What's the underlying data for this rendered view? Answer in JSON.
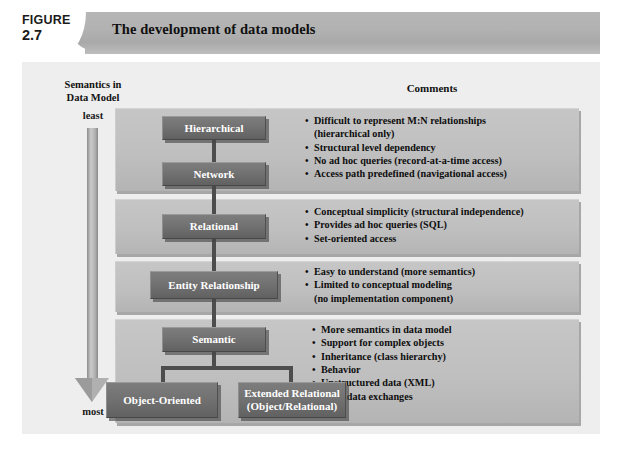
{
  "figure": {
    "label_word": "FIGURE",
    "number": "2.7",
    "title": "The development of data models"
  },
  "columns": {
    "left_heading_line1": "Semantics in",
    "left_heading_line2": "Data Model",
    "right_heading": "Comments"
  },
  "scale": {
    "top_label": "least",
    "bottom_label": "most",
    "direction": "down"
  },
  "groups": [
    {
      "id": "hierarchical-network",
      "boxes": [
        {
          "label": "Hierarchical"
        },
        {
          "label": "Network"
        }
      ],
      "comments": [
        {
          "text": "Difficult to represent M:N relationships",
          "bullet": true
        },
        {
          "text": "(hierarchical only)",
          "bullet": false
        },
        {
          "text": "Structural level dependency",
          "bullet": true
        },
        {
          "text": "No ad hoc queries (record-at-a-time access)",
          "bullet": true
        },
        {
          "text": "Access path predefined (navigational access)",
          "bullet": true
        }
      ]
    },
    {
      "id": "relational",
      "boxes": [
        {
          "label": "Relational"
        }
      ],
      "comments": [
        {
          "text": "Conceptual simplicity (structural independence)",
          "bullet": true
        },
        {
          "text": "Provides ad hoc queries (SQL)",
          "bullet": true
        },
        {
          "text": "Set-oriented access",
          "bullet": true
        }
      ]
    },
    {
      "id": "entity-relationship",
      "boxes": [
        {
          "label": "Entity Relationship"
        }
      ],
      "comments": [
        {
          "text": "Easy to understand (more semantics)",
          "bullet": true
        },
        {
          "text": "Limited to conceptual modeling",
          "bullet": true
        },
        {
          "text": "(no implementation component)",
          "bullet": false
        }
      ]
    },
    {
      "id": "semantic",
      "boxes": [
        {
          "label": "Semantic"
        },
        {
          "label": "Object-Oriented"
        },
        {
          "label_line1": "Extended Relational",
          "label_line2": "(Object/Relational)"
        }
      ],
      "comments": [
        {
          "text": "More semantics in data model",
          "bullet": true
        },
        {
          "text": "Support for complex objects",
          "bullet": true
        },
        {
          "text": "Inheritance (class hierarchy)",
          "bullet": true
        },
        {
          "text": "Behavior",
          "bullet": true
        },
        {
          "text": "Unstructured data (XML)",
          "bullet": true
        },
        {
          "text": "XML data exchanges",
          "bullet": true
        }
      ]
    }
  ],
  "colors": {
    "banner": "#b2b2b2",
    "panel": "#eeeeee",
    "group_panel": "#bfbfbf",
    "entity_box": "#727272",
    "connector": "#4d4d4d",
    "text_dark": "#111111",
    "text_light": "#ffffff"
  }
}
